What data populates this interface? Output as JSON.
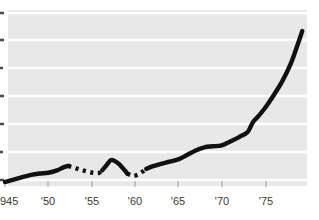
{
  "chart_data": {
    "type": "line",
    "title": "",
    "subtitle": "",
    "xlabel": "",
    "ylabel": "",
    "xlim": [
      1945,
      1979.5
    ],
    "ylim": [
      0,
      7
    ],
    "grid": true,
    "legend_position": "none",
    "x_tick_labels": [
      "945",
      "'50",
      "'55",
      "'60",
      "'65",
      "'70",
      "'75"
    ],
    "x_tick_values": [
      1945,
      1950,
      1955,
      1960,
      1965,
      1970,
      1975
    ],
    "y_tick_labels": [
      "",
      "",
      "",
      "",
      "",
      "",
      ""
    ],
    "y_tick_values": [
      0,
      1,
      2,
      3,
      4,
      5,
      6
    ],
    "y_axis_labels_cropped": true,
    "line_color": "#111111",
    "plot_background": "#e8e8e8",
    "gridline_color": "#ffffff",
    "page_background": "#ffffff",
    "series": [
      {
        "name": "series-1",
        "style": "mixed-solid-dashed",
        "segments": [
          {
            "style": "solid",
            "x": [
              1945.0,
              1946.0,
              1947.0,
              1948.0,
              1949.0,
              1950.0,
              1951.0,
              1951.8,
              1952.3
            ],
            "y": [
              0.17,
              0.26,
              0.36,
              0.45,
              0.5,
              0.53,
              0.62,
              0.75,
              0.8
            ]
          },
          {
            "style": "dashed",
            "x": [
              1952.3,
              1953.2,
              1954.0,
              1955.0,
              1955.8,
              1956.2
            ],
            "y": [
              0.8,
              0.7,
              0.62,
              0.54,
              0.52,
              0.62
            ]
          },
          {
            "style": "solid",
            "x": [
              1956.2,
              1956.8,
              1957.2,
              1957.6,
              1958.2,
              1958.8,
              1959.1
            ],
            "y": [
              0.62,
              0.86,
              1.02,
              1.0,
              0.86,
              0.63,
              0.5
            ]
          },
          {
            "style": "dashed",
            "x": [
              1959.1,
              1959.7,
              1960.3,
              1960.9,
              1961.3
            ],
            "y": [
              0.5,
              0.42,
              0.45,
              0.58,
              0.68
            ]
          },
          {
            "style": "solid",
            "x": [
              1961.3,
              1962.0,
              1963.0,
              1964.0,
              1965.0,
              1966.0,
              1967.0,
              1968.0,
              1969.0,
              1970.0,
              1971.0,
              1972.0,
              1973.0,
              1973.6,
              1974.2,
              1975.0,
              1976.0,
              1977.0,
              1978.0,
              1978.8,
              1979.3
            ],
            "y": [
              0.68,
              0.78,
              0.88,
              0.96,
              1.05,
              1.22,
              1.4,
              1.52,
              1.56,
              1.6,
              1.75,
              1.92,
              2.12,
              2.5,
              2.72,
              3.05,
              3.55,
              4.1,
              4.8,
              5.55,
              6.05
            ]
          }
        ]
      }
    ],
    "annotations": []
  }
}
